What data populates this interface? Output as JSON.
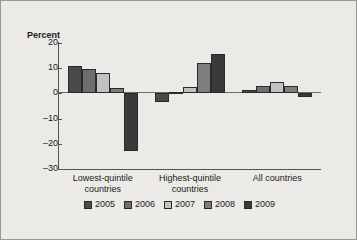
{
  "chart_data": {
    "type": "bar",
    "title": "",
    "subtitle": "",
    "xlabel": "",
    "ylabel": "Percent",
    "ylim": [
      -30,
      20
    ],
    "yticks": [
      20,
      10,
      0,
      -10,
      -20,
      -30
    ],
    "ytick_labels": [
      "20",
      "10",
      "0",
      "–10",
      "–20",
      "–30"
    ],
    "grid": false,
    "legend_position": "bottom",
    "categories": [
      "Lowest-quintile countries",
      "Highest-quintile countries",
      "All countries"
    ],
    "category_lines": [
      [
        "Lowest-quintile",
        "countries"
      ],
      [
        "Highest-quintile",
        "countries"
      ],
      [
        "All countries",
        ""
      ]
    ],
    "series": [
      {
        "name": "2005",
        "color": "#4a4a4a",
        "values": [
          11.0,
          -3.5,
          1.5
        ]
      },
      {
        "name": "2006",
        "color": "#6e6e6e",
        "values": [
          9.5,
          0.5,
          3.0
        ]
      },
      {
        "name": "2007",
        "color": "#c2c2c2",
        "values": [
          8.2,
          2.5,
          4.5
        ]
      },
      {
        "name": "2008",
        "color": "#7d7d7d",
        "values": [
          2.0,
          12.2,
          3.0
        ]
      },
      {
        "name": "2009",
        "color": "#3a3a3a",
        "values": [
          -23.0,
          15.6,
          -1.5
        ]
      }
    ]
  },
  "figure": {
    "background_color": "#eceae7",
    "border_color": "#9a9894",
    "axis_color": "#55524e",
    "bar_edge_color": "#2a2a2a"
  }
}
